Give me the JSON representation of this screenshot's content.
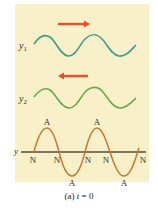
{
  "figure": {
    "caption_prefix": "(a) ",
    "caption_var": "t",
    "caption_suffix": " = 0",
    "colors": {
      "panel": "#f8f0c8",
      "arrow": "#e8502a",
      "wave1": "#3f9c8c",
      "wave2": "#6aaa4a",
      "standing_wave": "#c9752f",
      "axis": "#5a4a3a"
    },
    "waves": [
      {
        "label": "y",
        "subscript": "1",
        "direction": "right"
      },
      {
        "label": "y",
        "subscript": "2",
        "direction": "left"
      }
    ],
    "resultant": {
      "axis_label": "y",
      "antinode_label": "A",
      "node_label": "N",
      "antinodes_top": 2,
      "antinodes_bottom": 2,
      "nodes": 5
    }
  }
}
